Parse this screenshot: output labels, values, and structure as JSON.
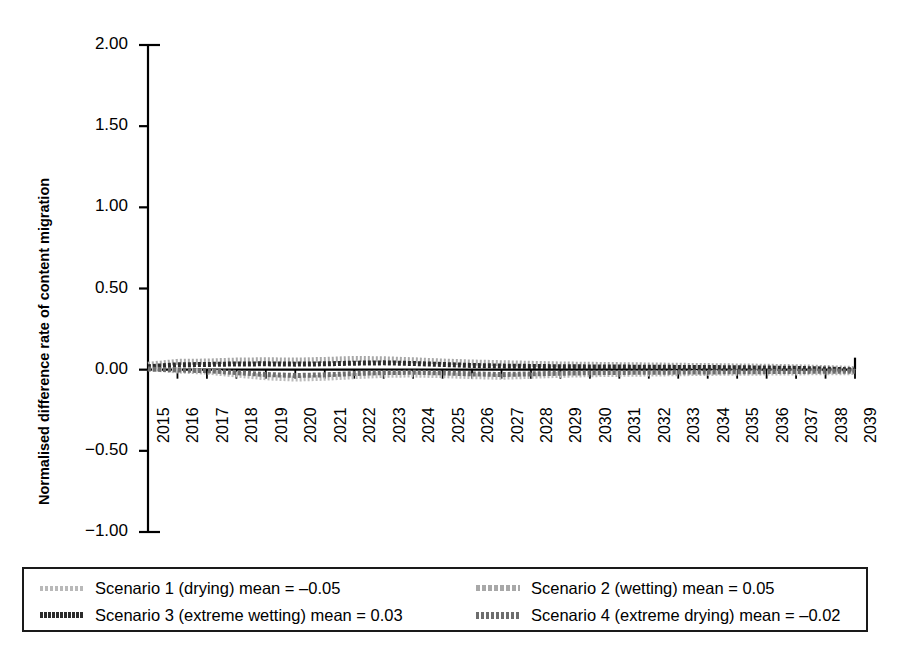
{
  "chart_data": {
    "type": "line",
    "title": "",
    "xlabel": "",
    "ylabel": "Normalised difference rate of content migration",
    "ylim": [
      -1.0,
      2.0
    ],
    "ytick_labels": [
      "2.00",
      "1.50",
      "1.00",
      "0.50",
      "0.00",
      "-0.50",
      "-1.00"
    ],
    "ytick_values": [
      2.0,
      1.5,
      1.0,
      0.5,
      0.0,
      -0.5,
      -1.0
    ],
    "grid": false,
    "legend_position": "below-plot",
    "categories": [
      "2015",
      "2016",
      "2017",
      "2018",
      "2019",
      "2020",
      "2021",
      "2022",
      "2023",
      "2024",
      "2025",
      "2026",
      "2027",
      "2028",
      "2029",
      "2030",
      "2031",
      "2032",
      "2033",
      "2034",
      "2035",
      "2036",
      "2037",
      "2038",
      "2039"
    ],
    "series": [
      {
        "name": "Scenario 1 (drying) mean = –0.05",
        "label": "Scenario 1 (drying) mean = –0.05",
        "mean": -0.05,
        "color": "#b9b9b9",
        "style": "dotted",
        "values": [
          0.01,
          -0.005,
          -0.012,
          -0.03,
          -0.047,
          -0.055,
          -0.05,
          -0.04,
          -0.032,
          -0.03,
          -0.034,
          -0.04,
          -0.044,
          -0.038,
          -0.032,
          -0.028,
          -0.026,
          -0.024,
          -0.022,
          -0.02,
          -0.019,
          -0.018,
          -0.017,
          -0.016,
          -0.015
        ]
      },
      {
        "name": "Scenario 2 (wetting) mean = 0.05",
        "label": "Scenario 2 (wetting) mean = 0.05",
        "mean": 0.05,
        "color": "#a8a8a8",
        "style": "dotted",
        "values": [
          0.03,
          0.048,
          0.05,
          0.056,
          0.058,
          0.056,
          0.06,
          0.066,
          0.064,
          0.058,
          0.05,
          0.044,
          0.04,
          0.036,
          0.032,
          0.03,
          0.028,
          0.026,
          0.024,
          0.022,
          0.02,
          0.018,
          0.015,
          0.01,
          0.004
        ]
      },
      {
        "name": "Scenario 3 (extreme wetting) mean = 0.03",
        "label": "Scenario 3 (extreme wetting) mean = 0.03",
        "mean": 0.03,
        "color": "#2b2b2b",
        "style": "dashed",
        "values": [
          0.018,
          0.03,
          0.032,
          0.035,
          0.036,
          0.034,
          0.036,
          0.04,
          0.042,
          0.038,
          0.032,
          0.026,
          0.022,
          0.02,
          0.018,
          0.017,
          0.016,
          0.015,
          0.014,
          0.013,
          0.012,
          0.01,
          0.008,
          0.004,
          -0.002
        ]
      },
      {
        "name": "Scenario 4 (extreme drying) mean = –0.02",
        "label": "Scenario 4 (extreme drying) mean = –0.02",
        "mean": -0.02,
        "color": "#6d6d6d",
        "style": "dashed",
        "values": [
          0.004,
          -0.002,
          -0.006,
          -0.018,
          -0.03,
          -0.036,
          -0.032,
          -0.024,
          -0.018,
          -0.016,
          -0.02,
          -0.026,
          -0.03,
          -0.026,
          -0.022,
          -0.019,
          -0.017,
          -0.016,
          -0.015,
          -0.014,
          -0.013,
          -0.012,
          -0.011,
          -0.01,
          -0.009
        ]
      }
    ],
    "legend": [
      {
        "label": "Scenario 1 (drying) mean = –0.05",
        "swatch": "sw-s1"
      },
      {
        "label": "Scenario 2 (wetting) mean = 0.05",
        "swatch": "sw-s2"
      },
      {
        "label": "Scenario 3 (extreme wetting) mean = 0.03",
        "swatch": "sw-s3"
      },
      {
        "label": "Scenario 4 (extreme drying) mean = –0.02",
        "swatch": "sw-s4"
      }
    ]
  }
}
